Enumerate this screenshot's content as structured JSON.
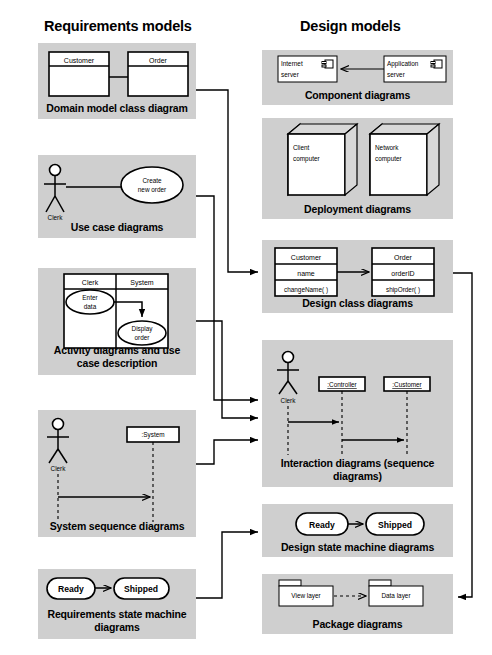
{
  "columns": {
    "left_title": "Requirements models",
    "right_title": "Design models"
  },
  "left_panels": [
    {
      "id": "domain-model-class-diagram",
      "label": "Domain model class diagram",
      "type": "class-diagram",
      "classes": [
        "Customer",
        "Order"
      ]
    },
    {
      "id": "use-case-diagrams",
      "label": "Use case diagrams",
      "type": "use-case-diagram",
      "actor": "Clerk",
      "use_case": "Create new order",
      "use_case_line1": "Create",
      "use_case_line2": "new order"
    },
    {
      "id": "activity-diagrams",
      "label": "Activity diagrams and use case description",
      "label_line1": "Activity diagrams and use",
      "label_line2": "case description",
      "type": "activity-diagram",
      "swimlanes": [
        "Clerk",
        "System"
      ],
      "actions": [
        {
          "line1": "Enter",
          "line2": "data"
        },
        {
          "line1": "Display",
          "line2": "order"
        }
      ]
    },
    {
      "id": "system-sequence-diagrams",
      "label": "System sequence diagrams",
      "type": "sequence-diagram",
      "actor": "Clerk",
      "lifelines": [
        ":System"
      ]
    },
    {
      "id": "requirements-state-machine-diagrams",
      "label": "Requirements state machine diagrams",
      "label_line1": "Requirements state machine",
      "label_line2": "diagrams",
      "type": "state-machine-diagram",
      "states": [
        "Ready",
        "Shipped"
      ]
    }
  ],
  "right_panels": [
    {
      "id": "component-diagrams",
      "label": "Component diagrams",
      "type": "component-diagram",
      "components": [
        {
          "line1": "Internet",
          "line2": "server"
        },
        {
          "line1": "Application",
          "line2": "server"
        }
      ]
    },
    {
      "id": "deployment-diagrams",
      "label": "Deployment diagrams",
      "type": "deployment-diagram",
      "nodes": [
        {
          "line1": "Client",
          "line2": "computer"
        },
        {
          "line1": "Network",
          "line2": "computer"
        }
      ]
    },
    {
      "id": "design-class-diagrams",
      "label": "Design class diagrams",
      "type": "design-class-diagram",
      "classes": [
        {
          "name": "Customer",
          "attribute": "name",
          "method": "changeName( )"
        },
        {
          "name": "Order",
          "attribute": "orderID",
          "method": "shipOrder( )"
        }
      ]
    },
    {
      "id": "interaction-diagrams",
      "label": "Interaction diagrams (sequence diagrams)",
      "label_line1": "Interaction diagrams (sequence",
      "label_line2": "diagrams)",
      "type": "interaction-diagram",
      "actor": "Clerk",
      "lifelines": [
        ":Controller",
        ":Customer"
      ]
    },
    {
      "id": "design-state-machine-diagrams",
      "label": "Design state machine diagrams",
      "type": "state-machine-diagram",
      "states": [
        "Ready",
        "Shipped"
      ]
    },
    {
      "id": "package-diagrams",
      "label": "Package diagrams",
      "type": "package-diagram",
      "packages": [
        "View layer",
        "Data layer"
      ]
    }
  ],
  "colors": {
    "panel_background": "#cfcfcf",
    "page_background": "#ffffff",
    "shape_fill": "#ffffff",
    "stroke": "#000000",
    "node_side": "#d8d8d8"
  }
}
